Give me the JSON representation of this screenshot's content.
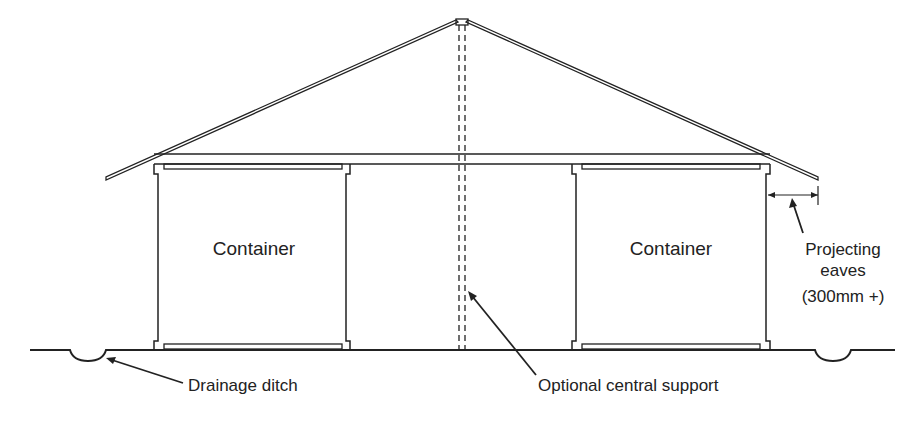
{
  "diagram": {
    "type": "cross-section elevation",
    "labels": {
      "container_left": "Container",
      "container_right": "Container",
      "eaves_line1": "Projecting",
      "eaves_line2": "eaves",
      "eaves_line3": "(300mm +)",
      "drainage": "Drainage ditch",
      "support": "Optional central support"
    },
    "colors": {
      "line": "#222222",
      "background": "#ffffff"
    }
  }
}
